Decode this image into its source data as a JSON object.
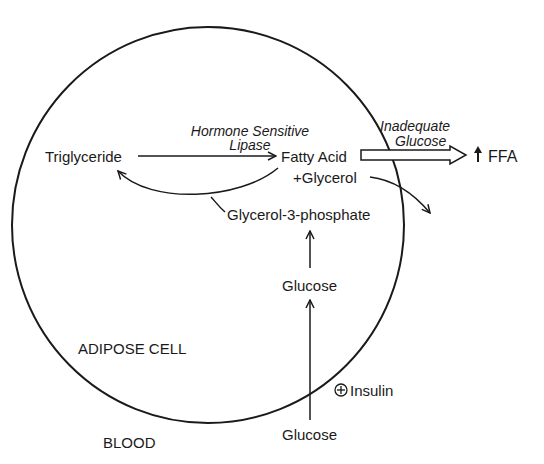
{
  "diagram": {
    "cell_label": "ADIPOSE CELL",
    "outside_label": "BLOOD",
    "nodes": {
      "triglyceride": "Triglyceride",
      "fatty_acid": "Fatty Acid",
      "glycerol": "+Glycerol",
      "glycerol_3_phosphate": "Glycerol-3-phosphate",
      "glucose_inside": "Glucose",
      "glucose_blood": "Glucose",
      "ffa": "FFA",
      "ffa_arrow": "↑"
    },
    "edge_labels": {
      "lipase_line1": "Hormone Sensitive",
      "lipase_line2": "Lipase",
      "inadequate_line1": "Inadequate",
      "inadequate_line2": "Glucose",
      "insulin_symbol": "⊕",
      "insulin": "Insulin"
    },
    "colors": {
      "stroke": "#1a1a1a",
      "background": "#ffffff"
    }
  }
}
